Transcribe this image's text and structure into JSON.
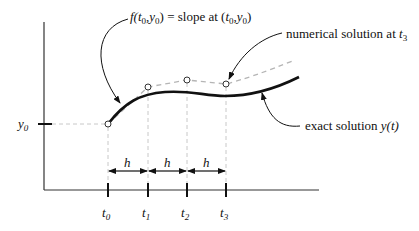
{
  "figure": {
    "type": "euler-method-diagram",
    "colors": {
      "exact_curve": "#111111",
      "numerical_dashed": "#b5b5b5",
      "guide_dashed": "#c8c8c8",
      "axes": "#333333",
      "text": "#111111"
    },
    "annotations": {
      "slope": {
        "prefix": "f(",
        "t": "t",
        "t_sub": "0",
        "comma": ",",
        "y": "y",
        "y_sub": "0",
        "suffix": ") = slope at (",
        "t2": "t",
        "t2_sub": "0",
        "comma2": ",",
        "y2": "y",
        "y2_sub": "0",
        "end": ")"
      },
      "numerical": {
        "text": "numerical solution at ",
        "var": "t",
        "sub": "3"
      },
      "exact": {
        "text": "exact solution ",
        "var": "y",
        "paren": "(t)"
      }
    },
    "y_axis": {
      "tick_label": "y",
      "tick_sub": "0"
    },
    "x_axis": {
      "ticks": [
        {
          "label": "t",
          "sub": "0"
        },
        {
          "label": "t",
          "sub": "1"
        },
        {
          "label": "t",
          "sub": "2"
        },
        {
          "label": "t",
          "sub": "3"
        }
      ]
    },
    "step_labels": [
      "h",
      "h",
      "h"
    ]
  }
}
